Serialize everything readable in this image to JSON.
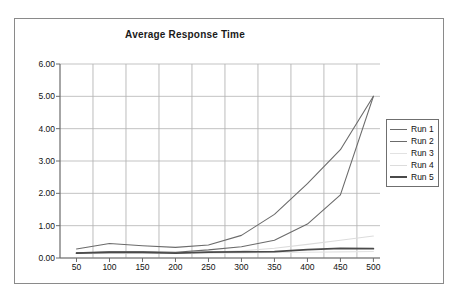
{
  "chart_data": {
    "type": "line",
    "title": "Average Response Time",
    "xlabel": "",
    "ylabel": "",
    "xlim": [
      25,
      510
    ],
    "ylim": [
      0,
      6
    ],
    "grid": true,
    "legend_position": "right",
    "x": [
      50,
      100,
      150,
      200,
      250,
      300,
      350,
      400,
      450,
      500
    ],
    "xticks": [
      "50",
      "100",
      "150",
      "200",
      "250",
      "300",
      "350",
      "400",
      "450",
      "500"
    ],
    "yticks": [
      "0.00",
      "1.00",
      "2.00",
      "3.00",
      "4.00",
      "5.00",
      "6.00"
    ],
    "ytick_values": [
      0,
      1,
      2,
      3,
      4,
      5,
      6
    ],
    "vertical_gridlines_at": [
      75,
      125,
      175,
      225,
      275,
      325,
      375,
      425,
      475
    ],
    "series": [
      {
        "name": "Run 1",
        "color": "#6b6b6b",
        "values": [
          0.28,
          0.45,
          0.38,
          0.33,
          0.4,
          0.7,
          1.35,
          2.3,
          3.35,
          5.0
        ]
      },
      {
        "name": "Run 2",
        "color": "#6b6b6b",
        "values": [
          0.16,
          0.2,
          0.2,
          0.18,
          0.25,
          0.35,
          0.55,
          1.05,
          1.95,
          5.0
        ]
      },
      {
        "name": "Run 3",
        "color": "#e2e2e2",
        "values": [
          0.14,
          0.15,
          0.15,
          0.14,
          0.15,
          0.16,
          0.17,
          0.18,
          0.19,
          0.2
        ]
      },
      {
        "name": "Run 4",
        "color": "#dcdcdc",
        "values": [
          0.15,
          0.16,
          0.16,
          0.16,
          0.18,
          0.22,
          0.3,
          0.42,
          0.55,
          0.68
        ]
      },
      {
        "name": "Run 5",
        "color": "#4a4a4a",
        "values": [
          0.15,
          0.17,
          0.17,
          0.15,
          0.18,
          0.19,
          0.2,
          0.26,
          0.3,
          0.29
        ]
      }
    ]
  },
  "legend": {
    "items": [
      {
        "label": "Run 1",
        "color": "#6b6b6b"
      },
      {
        "label": "Run 2",
        "color": "#6b6b6b"
      },
      {
        "label": "Run 3",
        "color": "#e2e2e2"
      },
      {
        "label": "Run 4",
        "color": "#dcdcdc"
      },
      {
        "label": "Run 5",
        "color": "#4a4a4a"
      }
    ]
  },
  "style": {
    "axis_color": "#6b6b6b",
    "grid_color": "#b4b4b4",
    "frame_color": "#8a8a8a",
    "text_color": "#111111"
  }
}
